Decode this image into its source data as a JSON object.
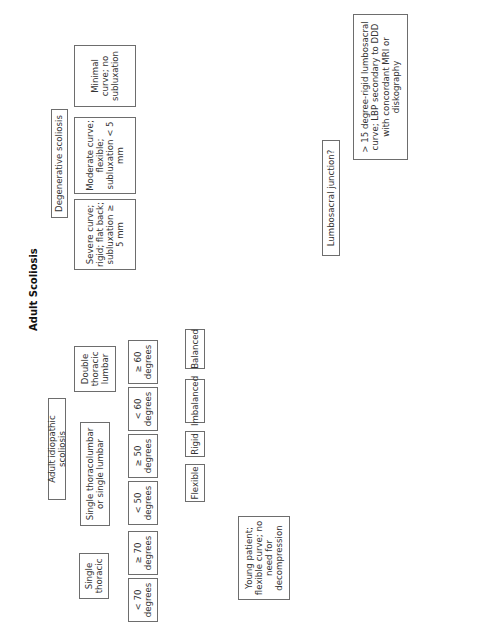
{
  "title": "Adult Scoliosis",
  "nodes": {
    "root": "Adult Scoliosis",
    "idiopathic": "Adult idiopathic scoliosis",
    "degenerative": "Degenerative scoliosis",
    "single_thoracic": "Single thoracic",
    "single_tl": "Single thoracolumbar or single lumbar",
    "double_tl": "Double thoracic lumbar",
    "st_lt70": "< 70 degrees",
    "st_ge70": "≥ 70 degrees",
    "tl_lt50": "< 50 degrees",
    "tl_ge50": "≥ 50 degrees",
    "dt_lt60": "< 60 degrees",
    "dt_ge60": "≥ 60 degrees",
    "psf": "PSF",
    "apsf": "A/PSF",
    "young": "Young patient; flexible curve; no need for decompression",
    "asf": "ASF",
    "flexible": "Flexible",
    "rigid": "Rigid",
    "imbalanced": "Imbalanced",
    "balanced": "Balanced",
    "psf_decomp_1": "PSF plus posterior decompression for neural compressive symptoms",
    "apsf_decomp": "A/PSF plus posterior decompression for neural compressive symptoms",
    "psf_decomp_2": "PSF plus posterior decompression for neural compressive symptoms",
    "severe": "Severe curve; rigid; flat back; subluxation ≥ 5 mm",
    "moderate": "Moderate curve; flexible; subluxation < 5 mm",
    "minimal": "Minimal curve; no subluxation",
    "ap_decomp": "AP decompression and fusion",
    "post_decomp": "Posterior decompression and fusion",
    "decomp_only": "Decompression only",
    "lumbosacral": "Lumbosacral junction?",
    "rigid_ls": "> 15 degree-rigid lumbosacral curve; LBP secondary to DDD with concordant MRI or diskography",
    "normal_disk": "Normal disk height; disk opens both ways on bending; no stenosis at that segment; no posterior column deficiency at L5",
    "include_l5": "Include L5–S1 in fusion",
    "avoid_l5": "Avoid fusion to L5–S1"
  }
}
